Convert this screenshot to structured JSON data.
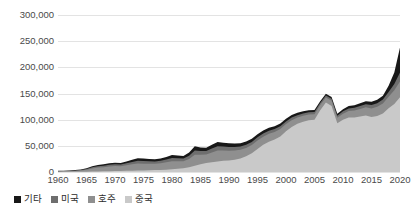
{
  "chart_data": {
    "type": "area",
    "stacked": true,
    "title": "",
    "subtitle": "",
    "xlabel": "",
    "ylabel": "",
    "xlim": [
      1960,
      2020
    ],
    "ylim": [
      0,
      300000
    ],
    "grid": true,
    "legend_position": "bottom-left",
    "x_tick_labels": [
      "1960",
      "1965",
      "1970",
      "1975",
      "1980",
      "1985",
      "1990",
      "1995",
      "2000",
      "2005",
      "2010",
      "2015",
      "2020"
    ],
    "x_tick_values": [
      1960,
      1965,
      1970,
      1975,
      1980,
      1985,
      1990,
      1995,
      2000,
      2005,
      2010,
      2015,
      2020
    ],
    "y_tick_labels": [
      "0",
      "50,000",
      "100,000",
      "150,000",
      "200,000",
      "250,000",
      "300,000"
    ],
    "y_tick_values": [
      0,
      50000,
      100000,
      150000,
      200000,
      250000,
      300000
    ],
    "x": [
      1960,
      1961,
      1962,
      1963,
      1964,
      1965,
      1966,
      1967,
      1968,
      1969,
      1970,
      1971,
      1972,
      1973,
      1974,
      1975,
      1976,
      1977,
      1978,
      1979,
      1980,
      1981,
      1982,
      1983,
      1984,
      1985,
      1986,
      1987,
      1988,
      1989,
      1990,
      1991,
      1992,
      1993,
      1994,
      1995,
      1996,
      1997,
      1998,
      1999,
      2000,
      2001,
      2002,
      2003,
      2004,
      2005,
      2006,
      2007,
      2008,
      2009,
      2010,
      2011,
      2012,
      2013,
      2014,
      2015,
      2016,
      2017,
      2018,
      2019,
      2020
    ],
    "series": [
      {
        "name": "중국",
        "color": "#c9c9c9",
        "stack_order": 1,
        "values": [
          200,
          300,
          400,
          500,
          600,
          700,
          900,
          1100,
          1300,
          1500,
          1800,
          2000,
          2300,
          2600,
          2800,
          3000,
          3300,
          3600,
          4000,
          4500,
          5200,
          6000,
          7000,
          9000,
          12000,
          15000,
          17000,
          18500,
          20000,
          21500,
          22000,
          23500,
          26000,
          30000,
          36000,
          44000,
          52000,
          58000,
          62000,
          68000,
          78000,
          86000,
          92000,
          96000,
          99000,
          100000,
          118000,
          133000,
          126000,
          93000,
          100000,
          104000,
          104000,
          106000,
          108000,
          105000,
          107000,
          112000,
          122000,
          130000,
          143000
        ]
      },
      {
        "name": "호주",
        "color": "#8f8f8f",
        "stack_order": 2,
        "values": [
          900,
          1000,
          1200,
          1500,
          2200,
          3500,
          6000,
          7500,
          8000,
          9000,
          9500,
          9000,
          10500,
          12000,
          13500,
          13000,
          12500,
          12000,
          12500,
          14000,
          15500,
          14500,
          13500,
          16000,
          21000,
          18000,
          16500,
          19000,
          21000,
          19500,
          18500,
          17500,
          16500,
          16000,
          15500,
          16000,
          15500,
          15000,
          14500,
          14000,
          13500,
          13000,
          12000,
          11500,
          11000,
          10500,
          10000,
          9500,
          10000,
          10500,
          11500,
          12500,
          13500,
          14500,
          15500,
          16500,
          17500,
          19000,
          22000,
          26000,
          30000
        ]
      },
      {
        "name": "미국",
        "color": "#6e6e6e",
        "stack_order": 3,
        "values": [
          600,
          700,
          800,
          900,
          1200,
          1600,
          2200,
          2600,
          2800,
          3200,
          3400,
          3300,
          3800,
          4500,
          5200,
          5000,
          4800,
          4600,
          4800,
          5400,
          6000,
          5600,
          5200,
          6200,
          8000,
          7000,
          6400,
          7400,
          8200,
          7600,
          7200,
          6800,
          6400,
          6200,
          6000,
          6200,
          6000,
          5800,
          5600,
          5400,
          5200,
          5000,
          4600,
          4400,
          4200,
          4000,
          3800,
          3600,
          3800,
          4000,
          4400,
          4800,
          5200,
          5600,
          6000,
          6400,
          6800,
          7400,
          9000,
          12000,
          17000
        ]
      },
      {
        "name": "기타",
        "color": "#181818",
        "stack_order": 4,
        "values": [
          500,
          600,
          700,
          800,
          1000,
          1400,
          1900,
          2300,
          2500,
          2900,
          3100,
          3000,
          3500,
          4200,
          4800,
          4600,
          4400,
          4200,
          4400,
          5000,
          5600,
          5200,
          4800,
          6000,
          8000,
          6800,
          6200,
          7200,
          8000,
          7400,
          7000,
          6600,
          6200,
          6000,
          5800,
          6000,
          5800,
          5600,
          5400,
          5200,
          5000,
          4800,
          4400,
          4200,
          4000,
          3800,
          3600,
          3400,
          3600,
          3800,
          4200,
          4600,
          5000,
          5400,
          5800,
          6200,
          6600,
          7200,
          12000,
          22000,
          48000
        ]
      }
    ],
    "notable_points": [
      {
        "year": 2007,
        "total": 161500,
        "note": "mid peak"
      },
      {
        "year": 2009,
        "total": 111300,
        "note": "dip"
      },
      {
        "year": 2020,
        "total": 238000,
        "note": "final peak"
      }
    ]
  },
  "legend": {
    "items": [
      {
        "label": "기타",
        "color": "#181818"
      },
      {
        "label": "미국",
        "color": "#6e6e6e"
      },
      {
        "label": "호주",
        "color": "#8f8f8f"
      },
      {
        "label": "중국",
        "color": "#c9c9c9"
      }
    ]
  }
}
